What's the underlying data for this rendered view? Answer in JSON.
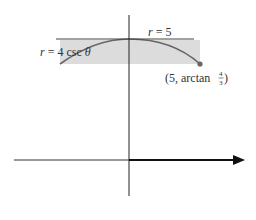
{
  "diagram": {
    "labels": {
      "line_label_var": "r",
      "line_label_eq": " = 5",
      "curve_label_var": "r",
      "curve_label_eq": " = 4 csc ",
      "curve_label_theta": "θ",
      "point_label_prefix": "(5, arctan ",
      "point_label_num": "4",
      "point_label_den": "3",
      "point_label_suffix": ")"
    },
    "colors": {
      "axis": "#222222",
      "line": "#444444",
      "curve": "#666666",
      "shade": "#dcdcdc",
      "point": "#666666",
      "text": "#333333"
    }
  }
}
